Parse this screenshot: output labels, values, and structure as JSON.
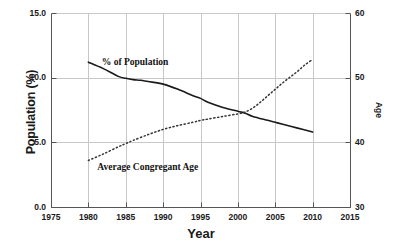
{
  "chart_data": {
    "type": "line",
    "title": "",
    "xlabel": "Year",
    "ylabel": "Population (%)",
    "y2label": "Age",
    "xlim": [
      1975,
      2015
    ],
    "ylim": [
      0.0,
      15.0
    ],
    "y2lim": [
      30,
      60
    ],
    "grid": true,
    "legend_position": "inline-annotations",
    "xticks": [
      "1975",
      "1980",
      "1985",
      "1990",
      "1995",
      "2000",
      "2005",
      "2010",
      "2015"
    ],
    "yticks_left": [
      "0.0",
      "5.0",
      "10.0",
      "15.0"
    ],
    "yticks_right": [
      "30",
      "40",
      "50",
      "60"
    ],
    "series": [
      {
        "name": "% of Population",
        "axis": "left",
        "style": "solid",
        "color": "#1a1a1a",
        "x": [
          1980,
          1982,
          1984,
          1985,
          1986,
          1987,
          1988,
          1990,
          1992,
          1994,
          1995,
          1996,
          1998,
          2000,
          2001,
          2002,
          2004,
          2005,
          2006,
          2008,
          2010
        ],
        "values": [
          11.2,
          10.7,
          10.1,
          9.95,
          9.85,
          9.8,
          9.7,
          9.5,
          9.1,
          8.6,
          8.4,
          8.1,
          7.7,
          7.4,
          7.25,
          7.0,
          6.7,
          6.55,
          6.4,
          6.1,
          5.8
        ]
      },
      {
        "name": "Average Congregant Age",
        "axis": "right",
        "style": "dotted",
        "color": "#333333",
        "x": [
          1980,
          1982,
          1984,
          1985,
          1986,
          1988,
          1990,
          1992,
          1994,
          1995,
          1996,
          1998,
          2000,
          2001,
          2002,
          2003,
          2004,
          2005,
          2006,
          2007,
          2008,
          2009,
          2010
        ],
        "values": [
          37.2,
          38.2,
          39.3,
          39.8,
          40.3,
          41.2,
          42.0,
          42.6,
          43.1,
          43.4,
          43.6,
          44.0,
          44.4,
          44.7,
          45.3,
          46.2,
          47.2,
          48.2,
          49.2,
          50.1,
          51.0,
          52.0,
          52.8
        ]
      }
    ],
    "annotations": [
      {
        "text": "% of Population",
        "x": 1981.8,
        "y_px": 57
      },
      {
        "text": "Average Congregant Age",
        "x": 1981.2,
        "y_px": 162
      }
    ]
  },
  "axes": {
    "left_title": "Population (%)",
    "right_title": "Age",
    "bottom_title": "Year"
  },
  "labels": {
    "population_series": "% of Population",
    "age_series": "Average Congregant Age"
  },
  "colors": {
    "background": "#ffffff",
    "axis": "#555555",
    "grid": "#c8c8c8",
    "solid_line": "#1a1a1a",
    "dotted_line": "#333333",
    "text": "#1a1a1a"
  }
}
